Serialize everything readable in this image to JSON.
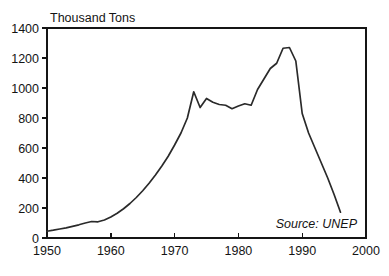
{
  "chart_data": {
    "type": "line",
    "title": "",
    "subtitle": "",
    "xlabel": "",
    "ylabel": "Thousand Tons",
    "ylabel_position": "top-left-inside",
    "xlim": [
      1950,
      2000
    ],
    "ylim": [
      0,
      1400
    ],
    "grid": false,
    "legend": false,
    "legend_position": "none",
    "x_ticks": [
      1950,
      1960,
      1970,
      1980,
      1990,
      2000
    ],
    "x_tick_labels": [
      "1950",
      "1960",
      "1970",
      "1980",
      "1990",
      "2000"
    ],
    "y_ticks": [
      0,
      200,
      400,
      600,
      800,
      1000,
      1200,
      1400
    ],
    "y_tick_labels": [
      "0",
      "200",
      "400",
      "600",
      "800",
      "1000",
      "1200",
      "1400"
    ],
    "annotations": [
      {
        "text": "Source: UNEP",
        "style": "italic",
        "position": "bottom-right-inside"
      }
    ],
    "series": [
      {
        "name": "CFC production",
        "color": "#2a2a2a",
        "x": [
          1950,
          1951,
          1952,
          1953,
          1954,
          1955,
          1956,
          1957,
          1958,
          1959,
          1960,
          1961,
          1962,
          1963,
          1964,
          1965,
          1966,
          1967,
          1968,
          1969,
          1970,
          1971,
          1972,
          1973,
          1974,
          1975,
          1976,
          1977,
          1978,
          1979,
          1980,
          1981,
          1982,
          1983,
          1984,
          1985,
          1986,
          1987,
          1988,
          1989,
          1990,
          1991,
          1992,
          1993,
          1994,
          1995,
          1996
        ],
        "values": [
          45,
          52,
          60,
          68,
          78,
          88,
          100,
          110,
          108,
          120,
          140,
          165,
          195,
          230,
          270,
          315,
          365,
          420,
          480,
          545,
          620,
          700,
          800,
          975,
          870,
          930,
          905,
          890,
          885,
          862,
          880,
          895,
          885,
          990,
          1060,
          1130,
          1165,
          1265,
          1270,
          1180,
          830,
          700,
          600,
          500,
          400,
          290,
          172
        ]
      }
    ]
  },
  "axes": {
    "y_axis_label": "Thousand Tons",
    "source_label": "Source: UNEP"
  }
}
